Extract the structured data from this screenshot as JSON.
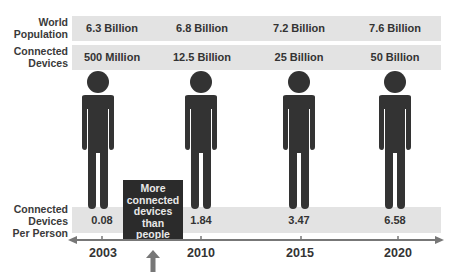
{
  "rows": {
    "world_population": {
      "label_line1": "World",
      "label_line2": "Population",
      "values": [
        "6.3 Billion",
        "6.8 Billion",
        "7.2 Billion",
        "7.6 Billion"
      ]
    },
    "connected_devices": {
      "label_line1": "Connected",
      "label_line2": "Devices",
      "values": [
        "500 Million",
        "12.5 Billion",
        "25 Billion",
        "50 Billion"
      ]
    },
    "devices_per_person": {
      "label_line1": "Connected",
      "label_line2": "Devices",
      "label_line3": "Per Person",
      "values": [
        "0.08",
        "1.84",
        "3.47",
        "6.58"
      ]
    }
  },
  "callout": {
    "line1": "More",
    "line2": "connected",
    "line3": "devices",
    "line4": "than",
    "line5": "people"
  },
  "timeline": {
    "years": [
      "2003",
      "2010",
      "2015",
      "2020"
    ]
  },
  "icons": {
    "person": "person-icon",
    "arrow_up": "arrow-up-icon"
  },
  "colors": {
    "band": "#e3e3e3",
    "figure": "#333333",
    "callout_bg": "#2b2b2b",
    "axis": "#777777"
  }
}
